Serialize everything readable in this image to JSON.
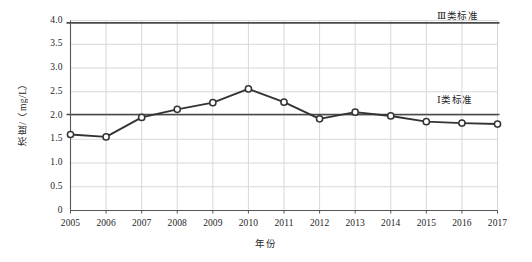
{
  "chart_data": {
    "type": "line",
    "title": "",
    "xlabel": "年份",
    "ylabel": "浓度/（mg/L）",
    "x": [
      2005,
      2006,
      2007,
      2008,
      2009,
      2010,
      2011,
      2012,
      2013,
      2014,
      2015,
      2016,
      2017
    ],
    "categories": [
      "2005",
      "2006",
      "2007",
      "2008",
      "2009",
      "2010",
      "2011",
      "2012",
      "2013",
      "2014",
      "2015",
      "2016",
      "2017"
    ],
    "series": [
      {
        "name": "浓度",
        "values": [
          1.6,
          1.55,
          1.96,
          2.13,
          2.27,
          2.56,
          2.28,
          1.93,
          2.07,
          1.99,
          1.87,
          1.84,
          1.82
        ],
        "marker": "open-circle",
        "color": "#333333"
      }
    ],
    "ylim": [
      0,
      4.0
    ],
    "ytick_values": [
      0,
      0.5,
      1.0,
      1.5,
      2.0,
      2.5,
      3.0,
      3.5,
      4.0
    ],
    "ytick_labels": [
      "0",
      "0.5",
      "1.0",
      "1.5",
      "2.0",
      "2.5",
      "3.0",
      "3.5",
      "4.0"
    ],
    "xlim": [
      2005,
      2017
    ],
    "grid": true,
    "legend": "none",
    "annotations": [
      {
        "name": "class-3-standard",
        "label": "Ⅲ类标准",
        "value": 3.95,
        "color": "#4a4a4a"
      },
      {
        "name": "class-1-standard",
        "label": "Ⅰ类标准",
        "value": 2.02,
        "color": "#4a4a4a"
      }
    ]
  },
  "style": {
    "grid_color": "#d8d8d8",
    "axis_color": "#555555",
    "line_color": "#333333",
    "marker_fill": "#ffffff",
    "threshold_color": "#4a4a4a",
    "background": "#ffffff"
  }
}
